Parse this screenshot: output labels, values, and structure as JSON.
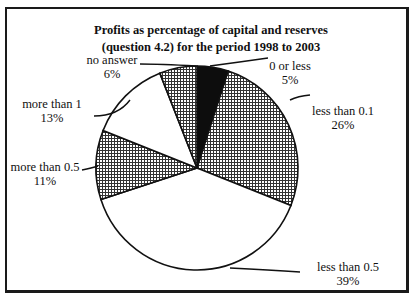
{
  "chart_data": {
    "type": "pie",
    "title": "Profits as percentage of capital and reserves (question 4.2) for the period 1998 to 2003",
    "title_lines": [
      "Profits as percentage of capital and reserves",
      "(question 4.2) for the period 1998 to 2003"
    ],
    "start_angle": "12 o'clock, clockwise",
    "slices": [
      {
        "label": "0 or less",
        "value": 5,
        "display": "5%",
        "fill": "black"
      },
      {
        "label": "less than 0.1",
        "value": 26,
        "display": "26%",
        "fill": "crosshatch"
      },
      {
        "label": "less than 0.5",
        "value": 39,
        "display": "39%",
        "fill": "white"
      },
      {
        "label": "more than 0.5",
        "value": 11,
        "display": "11%",
        "fill": "crosshatch"
      },
      {
        "label": "more than 1",
        "value": 13,
        "display": "13%",
        "fill": "white"
      },
      {
        "label": "no answer",
        "value": 6,
        "display": "6%",
        "fill": "crosshatch"
      }
    ],
    "legend": "none (leader-line labels)"
  }
}
